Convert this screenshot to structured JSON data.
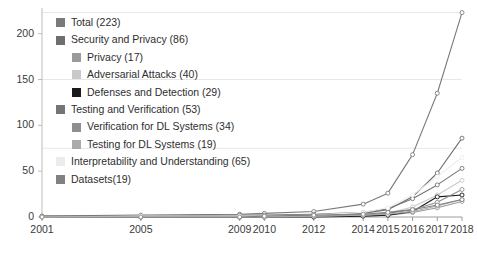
{
  "chart_data": {
    "type": "line",
    "title": "",
    "xlabel": "",
    "ylabel": "",
    "x": [
      "2001",
      "2005",
      "2009",
      "2010",
      "2012",
      "2014",
      "2015",
      "2016",
      "2017",
      "2018"
    ],
    "xlim": [
      2001,
      2018
    ],
    "ylim": [
      0,
      223
    ],
    "yticks": [
      0,
      50,
      100,
      150,
      200
    ],
    "gridlines": [
      75,
      150,
      223
    ],
    "grid": true,
    "legend_position": "upper-left",
    "markers": "open-circle",
    "series": [
      {
        "name": "Total",
        "label": "Total (223)",
        "count": 223,
        "color": "#7a7a7a",
        "indent": 0,
        "values": [
          1,
          2,
          3,
          4,
          6,
          14,
          26,
          68,
          135,
          223
        ]
      },
      {
        "name": "Security and Privacy",
        "label": "Security and Privacy (86)",
        "count": 86,
        "color": "#6e6e6e",
        "indent": 0,
        "values": [
          0,
          1,
          1,
          1,
          2,
          4,
          8,
          22,
          48,
          86
        ]
      },
      {
        "name": "Privacy",
        "label": "Privacy (17)",
        "count": 17,
        "color": "#9a9a9a",
        "indent": 1,
        "values": [
          0,
          0,
          0,
          0,
          1,
          1,
          2,
          5,
          10,
          17
        ]
      },
      {
        "name": "Adversarial Attacks",
        "label": "Adversarial Attacks (40)",
        "count": 40,
        "color": "#c9c9c9",
        "indent": 1,
        "values": [
          0,
          0,
          0,
          0,
          1,
          2,
          4,
          11,
          24,
          40
        ]
      },
      {
        "name": "Defenses and Detection",
        "label": "Defenses and Detection (29)",
        "count": 29,
        "color": "#1a1a1a",
        "indent": 1,
        "values": [
          0,
          0,
          0,
          0,
          0,
          1,
          2,
          6,
          22,
          24
        ]
      },
      {
        "name": "Testing and Verification",
        "label": "Testing and Verification (53)",
        "count": 53,
        "color": "#757575",
        "indent": 0,
        "values": [
          1,
          1,
          2,
          2,
          3,
          5,
          9,
          20,
          35,
          53
        ]
      },
      {
        "name": "Verification for DL Systems",
        "label": "Verification for DL Systems (34)",
        "count": 34,
        "color": "#8f8f8f",
        "indent": 1,
        "values": [
          0,
          0,
          1,
          1,
          1,
          2,
          4,
          8,
          16,
          30
        ]
      },
      {
        "name": "Testing for DL Systems",
        "label": "Testing for DL Systems (19)",
        "count": 19,
        "color": "#aaaaaa",
        "indent": 1,
        "values": [
          0,
          0,
          0,
          0,
          1,
          2,
          3,
          6,
          12,
          19
        ]
      },
      {
        "name": "Interpretability and Understanding",
        "label": "Interpretability and Understanding (65)",
        "count": 65,
        "color": "#ececec",
        "indent": 0,
        "values": [
          0,
          1,
          1,
          1,
          2,
          5,
          10,
          24,
          44,
          65
        ]
      },
      {
        "name": "Datasets",
        "label": "Datasets(19)",
        "count": 19,
        "color": "#818181",
        "indent": 0,
        "values": [
          0,
          0,
          0,
          1,
          2,
          3,
          5,
          8,
          13,
          19
        ]
      }
    ],
    "axis_color": "#bdbdbd",
    "grid_color": "#e8e8e8",
    "background": "#ffffff"
  }
}
